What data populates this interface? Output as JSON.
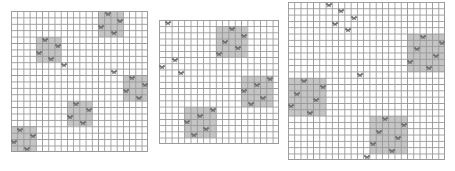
{
  "figure": "Three grid landscapes with shaded habitat patches and butterfly agents",
  "colors": {
    "grid_line": "#9a9a9a",
    "patch": "#a8a8a8",
    "butterfly": "#6e6e6e"
  },
  "grids": [
    {
      "name": "grid-1",
      "cols": 22,
      "rows": 22,
      "patches": [
        {
          "col": 14,
          "row": 0,
          "w": 4,
          "h": 4
        },
        {
          "col": 4,
          "row": 4,
          "w": 4,
          "h": 4
        },
        {
          "col": 18,
          "row": 10,
          "w": 4,
          "h": 4
        },
        {
          "col": 9,
          "row": 14,
          "w": 4,
          "h": 4
        },
        {
          "col": 0,
          "row": 18,
          "w": 4,
          "h": 4
        }
      ],
      "butterflies": [
        [
          15,
          0
        ],
        [
          17,
          1
        ],
        [
          14,
          2
        ],
        [
          16,
          3
        ],
        [
          5,
          4
        ],
        [
          7,
          5
        ],
        [
          4,
          6
        ],
        [
          6,
          7
        ],
        [
          8,
          8
        ],
        [
          16,
          9
        ],
        [
          19,
          10
        ],
        [
          21,
          11
        ],
        [
          18,
          12
        ],
        [
          20,
          13
        ],
        [
          10,
          14
        ],
        [
          12,
          15
        ],
        [
          9,
          16
        ],
        [
          11,
          17
        ],
        [
          1,
          18
        ],
        [
          3,
          19
        ],
        [
          0,
          20
        ],
        [
          2,
          21
        ]
      ]
    },
    {
      "name": "grid-2",
      "cols": 19,
      "rows": 20,
      "patches": [
        {
          "col": 9,
          "row": 1,
          "w": 5,
          "h": 5
        },
        {
          "col": 13,
          "row": 9,
          "w": 5,
          "h": 5
        },
        {
          "col": 4,
          "row": 14,
          "w": 5,
          "h": 5
        }
      ],
      "butterflies": [
        [
          1,
          0
        ],
        [
          11,
          1
        ],
        [
          10,
          3
        ],
        [
          12,
          4
        ],
        [
          9,
          5
        ],
        [
          13,
          2
        ],
        [
          2,
          6
        ],
        [
          0,
          7
        ],
        [
          3,
          8
        ],
        [
          17,
          9
        ],
        [
          15,
          10
        ],
        [
          13,
          11
        ],
        [
          16,
          12
        ],
        [
          14,
          13
        ],
        [
          8,
          14
        ],
        [
          6,
          15
        ],
        [
          4,
          16
        ],
        [
          7,
          17
        ],
        [
          5,
          18
        ]
      ]
    },
    {
      "name": "grid-3",
      "cols": 25,
      "rows": 25,
      "patches": [
        {
          "col": 19,
          "row": 5,
          "w": 6,
          "h": 6
        },
        {
          "col": 0,
          "row": 12,
          "w": 6,
          "h": 6
        },
        {
          "col": 13,
          "row": 18,
          "w": 6,
          "h": 6
        }
      ],
      "butterflies": [
        [
          6,
          0
        ],
        [
          8,
          1
        ],
        [
          10,
          2
        ],
        [
          7,
          3
        ],
        [
          9,
          4
        ],
        [
          21,
          5
        ],
        [
          24,
          6
        ],
        [
          20,
          7
        ],
        [
          23,
          8
        ],
        [
          19,
          9
        ],
        [
          22,
          10
        ],
        [
          11,
          11
        ],
        [
          2,
          12
        ],
        [
          5,
          13
        ],
        [
          1,
          14
        ],
        [
          4,
          15
        ],
        [
          0,
          16
        ],
        [
          3,
          17
        ],
        [
          15,
          18
        ],
        [
          18,
          19
        ],
        [
          14,
          20
        ],
        [
          17,
          21
        ],
        [
          13,
          22
        ],
        [
          16,
          23
        ],
        [
          12,
          24
        ]
      ]
    }
  ]
}
